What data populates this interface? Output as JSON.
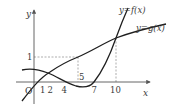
{
  "diagram": {
    "axes": {
      "x_label": "x",
      "y_label": "y",
      "origin_label": "O"
    },
    "x_ticks": [
      {
        "label": "1",
        "x": 42.5
      },
      {
        "label": "2",
        "x": 50
      },
      {
        "label": "4",
        "x": 64
      },
      {
        "label": "5",
        "x": 78
      },
      {
        "label": "7",
        "x": 94
      },
      {
        "label": "10",
        "x": 116
      }
    ],
    "y_ticks": [
      {
        "label": "1",
        "y": 57
      }
    ],
    "curves": {
      "f_label": "y=f(x)",
      "g_label": "y=g(x)"
    },
    "colors": {
      "curve": "#1f1f1f",
      "axis": "#555555",
      "dashed": "#8a8a8a",
      "text": "#3a3a3a"
    }
  }
}
